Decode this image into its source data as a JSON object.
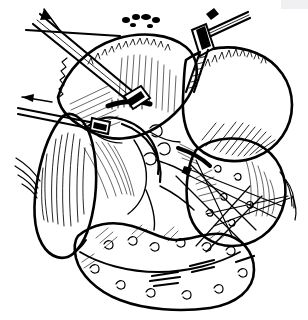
{
  "figure": {
    "title": "Operative field line illustration",
    "medium": "pen-and-ink line drawing",
    "palette": {
      "ink": "#000000",
      "background": "#ffffff",
      "smudge": "#f0f0f2"
    },
    "canvas": {
      "width": 308,
      "height": 320
    }
  },
  "structures": [
    {
      "id": "liver-right-lobe",
      "label": "large rounded lobe, upper right",
      "region": "upper-right",
      "shading": "parallel hatching along lower margin"
    },
    {
      "id": "liver-left-lobe",
      "label": "rounded lobe, upper centre",
      "region": "upper-centre",
      "shading": "stippled serrated border"
    },
    {
      "id": "lower-right-lobe",
      "label": "rounded mass, mid right",
      "region": "mid-right",
      "shading": "fine hatching"
    },
    {
      "id": "gallbladder",
      "label": "elongated pear-shaped organ, left",
      "region": "mid-left",
      "shading": "dense vertical hatching"
    },
    {
      "id": "omentum",
      "label": "lobulated fatty apron across the base",
      "region": "lower",
      "shading": "short curled fat marks"
    },
    {
      "id": "porta-hepatis",
      "label": "central duct and vessel bundle",
      "region": "centre",
      "shading": "tubular outlines"
    }
  ],
  "instruments": [
    {
      "id": "clamp-upper-left",
      "label": "long clamp entering from upper left",
      "direction_arrow": "up-left"
    },
    {
      "id": "clamp-left",
      "label": "grasping clamp at left border",
      "direction_arrow": "left"
    },
    {
      "id": "retractor-upper-right",
      "label": "retractor blade at upper right",
      "direction_arrow": "none"
    },
    {
      "id": "traction-sutures",
      "label": "crossed traction threads, lower right",
      "direction_arrow": "none"
    }
  ],
  "annotations": {
    "arrow_count": 2,
    "arrow_meaning": "direction of retraction"
  }
}
